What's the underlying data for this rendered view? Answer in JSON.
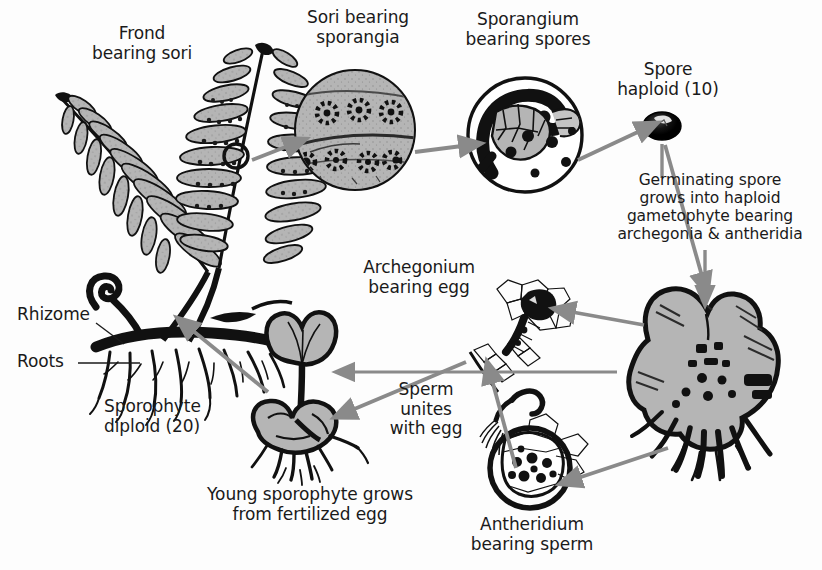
{
  "diagram": {
    "background_color": "#fdfdfd",
    "text_color": "#1a1a1a",
    "arrow_color": "#8a8a8a",
    "fill_gray": "#b5b5b5",
    "ink_color": "#111111"
  },
  "labels": {
    "frond": "Frond\nbearing sori",
    "sori": "Sori bearing\nsporangia",
    "sporangium": "Sporangium\nbearing spores",
    "spore": "Spore\nhaploid (10)",
    "germinating": "Germinating spore\ngrows into haploid\ngametophyte bearing\narchegonia & antheridia",
    "archegonium": "Archegonium\nbearing egg",
    "antheridium": "Antheridium\nbearing sperm",
    "sperm_unites": "Sperm\nunites\nwith egg",
    "young_sporophyte": "Young sporophyte grows\nfrom fertilized egg",
    "sporophyte": "Sporophyte\ndiploid (20)",
    "rhizome": "Rhizome",
    "roots": "Roots"
  },
  "stages": [
    {
      "id": "frond",
      "name": "Frond bearing sori",
      "ploidy": "diploid (20)"
    },
    {
      "id": "sori",
      "name": "Sori bearing sporangia",
      "ploidy": "diploid (20)"
    },
    {
      "id": "sporangium",
      "name": "Sporangium bearing spores",
      "ploidy": ""
    },
    {
      "id": "spore",
      "name": "Spore",
      "ploidy": "haploid (10)"
    },
    {
      "id": "gametophyte",
      "name": "Gametophyte (prothallus)",
      "ploidy": "haploid (10)"
    },
    {
      "id": "archegonium",
      "name": "Archegonium bearing egg",
      "ploidy": "haploid (10)"
    },
    {
      "id": "antheridium",
      "name": "Antheridium bearing sperm",
      "ploidy": "haploid (10)"
    },
    {
      "id": "young-sporophyte",
      "name": "Young sporophyte grows from fertilized egg",
      "ploidy": "diploid (20)"
    }
  ],
  "flow": [
    "Frond bearing sori",
    "Sori bearing sporangia",
    "Sporangium bearing spores",
    "Spore haploid (10)",
    "Germinating spore grows into haploid gametophyte bearing archegonia & antheridia",
    "Archegonium bearing egg",
    "Antheridium bearing sperm",
    "Sperm unites with egg",
    "Young sporophyte grows from fertilized egg",
    "Sporophyte diploid (20)"
  ]
}
